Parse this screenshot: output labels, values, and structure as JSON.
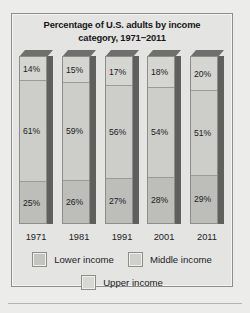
{
  "chart_data": {
    "type": "bar",
    "subtype": "stacked-100-percent-vertical-3d",
    "title": "Percentage of U.S. adults by income category, 1971−2011",
    "title_line1": "Percentage of U.S. adults by income",
    "title_line2": "category, 1971−2011",
    "xlabel": "",
    "ylabel": "",
    "ylim": [
      0,
      100
    ],
    "grid": false,
    "legend_position": "bottom",
    "categories": [
      "1971",
      "1981",
      "1991",
      "2001",
      "2011"
    ],
    "stack_order_top_to_bottom": [
      "Upper income",
      "Middle income",
      "Lower income"
    ],
    "series": [
      {
        "name": "Upper income",
        "values": [
          14,
          15,
          17,
          18,
          20
        ],
        "color": "#d5d5d1"
      },
      {
        "name": "Middle income",
        "values": [
          61,
          59,
          56,
          54,
          51
        ],
        "color": "#cdcdc9"
      },
      {
        "name": "Lower income",
        "values": [
          25,
          26,
          27,
          28,
          29
        ],
        "color": "#bdbdb9"
      }
    ],
    "bars": [
      {
        "year": "1971",
        "upper": "14%",
        "middle": "61%",
        "lower": "25%",
        "upper_val": 14,
        "middle_val": 61,
        "lower_val": 25
      },
      {
        "year": "1981",
        "upper": "15%",
        "middle": "59%",
        "lower": "26%",
        "upper_val": 15,
        "middle_val": 59,
        "lower_val": 26
      },
      {
        "year": "1991",
        "upper": "17%",
        "middle": "56%",
        "lower": "27%",
        "upper_val": 17,
        "middle_val": 56,
        "lower_val": 27
      },
      {
        "year": "2001",
        "upper": "18%",
        "middle": "54%",
        "lower": "28%",
        "upper_val": 18,
        "middle_val": 54,
        "lower_val": 28
      },
      {
        "year": "2011",
        "upper": "20%",
        "middle": "51%",
        "lower": "29%",
        "upper_val": 20,
        "middle_val": 51,
        "lower_val": 29
      }
    ]
  },
  "legend": {
    "items": [
      {
        "label": "Lower income",
        "swatch": "sw-lower"
      },
      {
        "label": "Middle income",
        "swatch": "sw-middle"
      },
      {
        "label": "Upper income",
        "swatch": "sw-upper"
      }
    ]
  },
  "colors": {
    "page_background": "#ececeb",
    "panel_background": "#e4e4e2",
    "panel_border": "#8e8e8c",
    "bar_outline": "#8d8d8b",
    "bar_shadow_side": "#5f5f5e",
    "bar_shadow_top": "#6f6f6e",
    "upper_income": "#d5d5d1",
    "middle_income": "#cdcdc9",
    "lower_income": "#bdbdb9",
    "text": "#1c1c1e"
  }
}
